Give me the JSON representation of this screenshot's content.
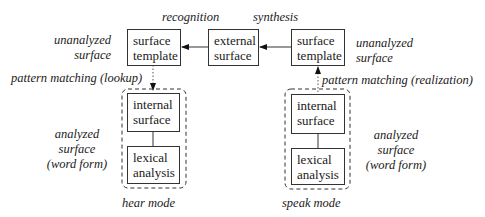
{
  "diagram": {
    "top_labels": {
      "recognition": "recognition",
      "synthesis": "synthesis"
    },
    "boxes": {
      "left_surface_template": [
        "surface",
        "template"
      ],
      "external_surface": [
        "external",
        "surface"
      ],
      "right_surface_template": [
        "surface",
        "template"
      ],
      "left_internal_surface": [
        "internal",
        "surface"
      ],
      "left_lexical_analysis": [
        "lexical",
        "analysis"
      ],
      "right_internal_surface": [
        "internal",
        "surface"
      ],
      "right_lexical_analysis": [
        "lexical",
        "analysis"
      ]
    },
    "side_labels": {
      "left_unanalyzed": [
        "unanalyzed",
        "surface"
      ],
      "right_unanalyzed": [
        "unanalyzed",
        "surface"
      ],
      "left_analyzed": [
        "analyzed",
        "surface",
        "(word form)"
      ],
      "right_analyzed": [
        "analyzed",
        "surface",
        "(word form)"
      ]
    },
    "edge_labels": {
      "lookup": "pattern matching (lookup)",
      "realization": "pattern matching (realization)"
    },
    "mode_labels": {
      "hear": "hear mode",
      "speak": "speak mode"
    }
  }
}
